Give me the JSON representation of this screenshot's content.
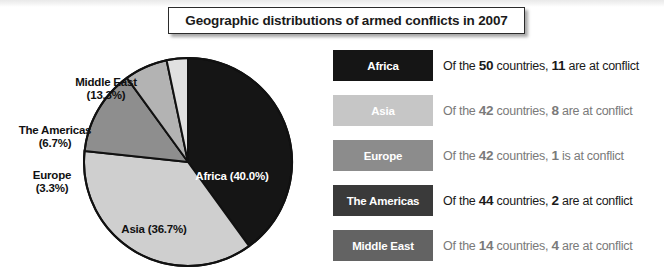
{
  "title": {
    "text": "Geographic distributions of armed conflicts in 2007"
  },
  "chart_data": {
    "type": "pie",
    "title": "Geographic distributions of armed conflicts in 2007",
    "categories": [
      "Africa",
      "Asia",
      "Middle East",
      "The Americas",
      "Europe"
    ],
    "values": [
      40.0,
      36.7,
      13.3,
      6.7,
      3.3
    ],
    "value_unit": "%",
    "counts_at_conflict": [
      11,
      8,
      4,
      2,
      1
    ],
    "total_countries": [
      50,
      42,
      14,
      44,
      42
    ],
    "slice_colors": [
      "#151515",
      "#cfcfcf",
      "#8e8e8e",
      "#b3b3b3",
      "#e0e0e0"
    ],
    "start_angle_deg": 0,
    "direction": "clockwise",
    "legend_position": "right",
    "grid": false,
    "labels": [
      {
        "name": "Africa",
        "pct": "(40.0%)"
      },
      {
        "name": "Asia",
        "pct": "(36.7%)"
      },
      {
        "name": "Middle East",
        "pct": "(13.3%)"
      },
      {
        "name": "The Americas",
        "pct": "(6.7%)"
      },
      {
        "name": "Europe",
        "pct": "(3.3%)"
      }
    ]
  },
  "pie_labels": {
    "africa": {
      "name": "Africa",
      "pct": "(40.0%)"
    },
    "asia": {
      "name": "Asia",
      "pct": "(36.7%)"
    },
    "middle_east": {
      "name": "Middle East",
      "pct": "(13.3%)"
    },
    "americas": {
      "name": "The Americas",
      "pct": "(6.7%)"
    },
    "europe": {
      "name": "Europe",
      "pct": "(3.3%)"
    }
  },
  "legend": {
    "rows": [
      {
        "label": "Africa",
        "swatch_color": "#151515",
        "label_color": "#ffffff",
        "desc_prefix": "Of the ",
        "total": "50",
        "desc_mid": " countries, ",
        "conflicts": "11",
        "desc_suffix": " are at conflict",
        "muted": false
      },
      {
        "label": "Asia",
        "swatch_color": "#c6c6c6",
        "label_color": "#ffffff",
        "desc_prefix": "Of the ",
        "total": "42",
        "desc_mid": " countries, ",
        "conflicts": "8",
        "desc_suffix": " are at conflict",
        "muted": true
      },
      {
        "label": "Europe",
        "swatch_color": "#8c8c8c",
        "label_color": "#ffffff",
        "desc_prefix": "Of the ",
        "total": "42",
        "desc_mid": " countries, ",
        "conflicts": "1",
        "desc_suffix": " is at conflict",
        "muted": true
      },
      {
        "label": "The Americas",
        "swatch_color": "#3a3a3a",
        "label_color": "#ffffff",
        "desc_prefix": "Of the ",
        "total": "44",
        "desc_mid": " countries, ",
        "conflicts": "2",
        "desc_suffix": " are at conflict",
        "muted": false
      },
      {
        "label": "Middle East",
        "swatch_color": "#636363",
        "label_color": "#ffffff",
        "desc_prefix": "Of the ",
        "total": "14",
        "desc_mid": " countries, ",
        "conflicts": "4",
        "desc_suffix": " are at conflict",
        "muted": true
      }
    ]
  }
}
